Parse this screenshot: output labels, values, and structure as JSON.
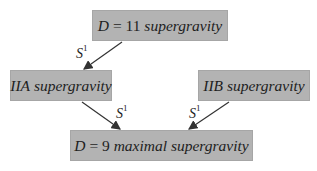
{
  "diagram": {
    "nodes": [
      {
        "id": "d11",
        "math": "D",
        "eq": " = 11 ",
        "label": "supergravity"
      },
      {
        "id": "iia",
        "math": "IIA",
        "label": " supergravity"
      },
      {
        "id": "iib",
        "math": "IIB",
        "label": " supergravity"
      },
      {
        "id": "d9",
        "math": "D",
        "eq": " = 9 ",
        "label": "maximal supergravity"
      }
    ],
    "edges": [
      {
        "from": "d11",
        "to": "iia",
        "label": "S",
        "sup": "1"
      },
      {
        "from": "iia",
        "to": "d9",
        "label": "S",
        "sup": "1"
      },
      {
        "from": "iib",
        "to": "d9",
        "label": "S",
        "sup": "1"
      }
    ],
    "colors": {
      "box_fill": "#b3b3b3",
      "arrow": "#333333"
    }
  }
}
